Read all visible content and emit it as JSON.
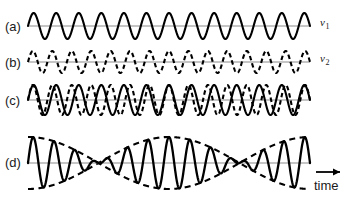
{
  "figure": {
    "background_color": "#ffffff",
    "wave_color": "#000000",
    "axis_color": "#8c8c8c",
    "width": 347,
    "height": 203
  },
  "panels": [
    {
      "id": "a",
      "label": "(a)",
      "wave_label": "ν",
      "wave_label_sub": "1",
      "style": "solid",
      "description": "First pure sinusoidal wave of frequency nu-1",
      "baseline_y": 26,
      "amplitude": 13,
      "cycles": 12.5,
      "phase_deg": 0
    },
    {
      "id": "b",
      "label": "(b)",
      "wave_label": "ν",
      "wave_label_sub": "2",
      "style": "dashed",
      "description": "Second pure sinusoidal wave of slightly higher frequency nu-2",
      "baseline_y": 62,
      "amplitude": 11,
      "cycles": 14.5,
      "phase_deg": 0
    },
    {
      "id": "c",
      "label": "(c)",
      "wave_label": "",
      "wave_label_sub": "",
      "style": "overlaid",
      "description": "Both waves overlaid showing progressive phase drift",
      "baseline_y": 100,
      "amplitude": 15,
      "cycles": 12.5,
      "cycles_second": 14.5,
      "phase_deg": 0
    },
    {
      "id": "d",
      "label": "(d)",
      "wave_label": "",
      "wave_label_sub": "",
      "style": "sum-with-envelope",
      "description": "Sum of the two waves producing beats, with dashed envelope",
      "baseline_y": 163,
      "amplitude": 26,
      "cycles": 13.5,
      "beat_cycles": 2,
      "envelope": "dashed",
      "phase_deg": 0
    }
  ],
  "axis": {
    "label": "time",
    "arrow": "right-arrow-icon",
    "x_start": 28,
    "x_end": 310
  },
  "chart_data": {
    "type": "line",
    "title": "",
    "xlabel": "time",
    "ylabel": "",
    "grid": false,
    "legend": "none",
    "x_range": [
      0,
      1
    ],
    "series": [
      {
        "name": "ν₁",
        "panel": "a",
        "style": "solid",
        "frequency_cycles": 12.5,
        "amplitude": 1.0,
        "phase": 0
      },
      {
        "name": "ν₂",
        "panel": "b",
        "style": "dashed",
        "frequency_cycles": 14.5,
        "amplitude": 1.0,
        "phase": 0
      },
      {
        "name": "ν₁ + ν₂ overlaid",
        "panel": "c",
        "style": "solid+dashed",
        "frequency_cycles": 12.5,
        "frequency_cycles_2": 14.5,
        "amplitude": 1.0,
        "phase": 0
      },
      {
        "name": "sum (beats)",
        "panel": "d",
        "style": "solid",
        "carrier_cycles": 13.5,
        "envelope_cycles": 1.0,
        "beat_nodes": 2,
        "amplitude": 1.0,
        "phase": 0
      },
      {
        "name": "envelope",
        "panel": "d",
        "style": "dashed",
        "envelope_cycles": 1.0,
        "amplitude": 1.0
      }
    ]
  }
}
